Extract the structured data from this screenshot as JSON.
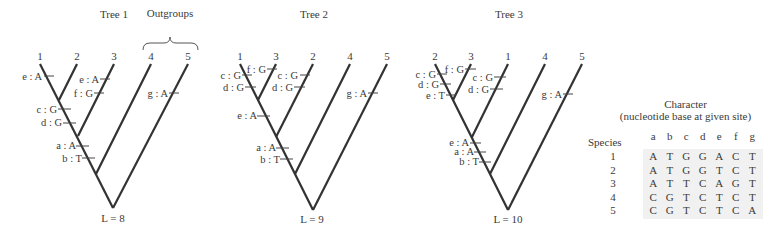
{
  "trees": [
    {
      "title": "Tree 1",
      "tips": [
        "1",
        "2",
        "3",
        "4",
        "5"
      ],
      "length_label": "L = 8",
      "outgroup_label": "Outgroups",
      "changes": [
        {
          "label": "e : A",
          "branch": "1"
        },
        {
          "label": "e : A",
          "branch": "3"
        },
        {
          "label": "f : G",
          "branch": "3"
        },
        {
          "label": "g : A",
          "branch": "5"
        },
        {
          "label": "c : G",
          "branch": "(1,2)"
        },
        {
          "label": "d : G",
          "branch": "(1,2)"
        },
        {
          "label": "a : A",
          "branch": "(1,2,3)"
        },
        {
          "label": "b : T",
          "branch": "(1,2,3)"
        }
      ]
    },
    {
      "title": "Tree 2",
      "tips": [
        "1",
        "3",
        "2",
        "4",
        "5"
      ],
      "length_label": "L = 9",
      "changes": [
        {
          "label": "c : G",
          "branch": "1"
        },
        {
          "label": "d : G",
          "branch": "1"
        },
        {
          "label": "f : G",
          "branch": "3"
        },
        {
          "label": "c : G",
          "branch": "2"
        },
        {
          "label": "d : G",
          "branch": "2"
        },
        {
          "label": "g : A",
          "branch": "5"
        },
        {
          "label": "e : A",
          "branch": "(1,3)"
        },
        {
          "label": "a : A",
          "branch": "(1,3,2)"
        },
        {
          "label": "b : T",
          "branch": "(1,3,2)"
        }
      ]
    },
    {
      "title": "Tree 3",
      "tips": [
        "2",
        "3",
        "1",
        "4",
        "5"
      ],
      "length_label": "L = 10",
      "changes": [
        {
          "label": "c : G",
          "branch": "2"
        },
        {
          "label": "d : G",
          "branch": "2"
        },
        {
          "label": "e : T",
          "branch": "2"
        },
        {
          "label": "f : G",
          "branch": "3"
        },
        {
          "label": "c : G",
          "branch": "1"
        },
        {
          "label": "d : G",
          "branch": "1"
        },
        {
          "label": "g : A",
          "branch": "5"
        },
        {
          "label": "e : A",
          "branch": "(2,3)"
        },
        {
          "label": "a : A",
          "branch": "(2,3,1)"
        },
        {
          "label": "b : T",
          "branch": "(2,3,1)"
        }
      ]
    }
  ],
  "table": {
    "title": "Character",
    "subtitle": "(nucleotide base at given site)",
    "row_header": "Species",
    "columns": [
      "a",
      "b",
      "c",
      "d",
      "e",
      "f",
      "g"
    ],
    "rows": [
      {
        "species": "1",
        "bases": [
          "A",
          "T",
          "G",
          "G",
          "A",
          "C",
          "T"
        ]
      },
      {
        "species": "2",
        "bases": [
          "A",
          "T",
          "G",
          "G",
          "T",
          "C",
          "T"
        ]
      },
      {
        "species": "3",
        "bases": [
          "A",
          "T",
          "T",
          "C",
          "A",
          "G",
          "T"
        ]
      },
      {
        "species": "4",
        "bases": [
          "C",
          "G",
          "T",
          "C",
          "T",
          "C",
          "T"
        ]
      },
      {
        "species": "5",
        "bases": [
          "C",
          "G",
          "T",
          "C",
          "T",
          "C",
          "A"
        ]
      }
    ]
  }
}
